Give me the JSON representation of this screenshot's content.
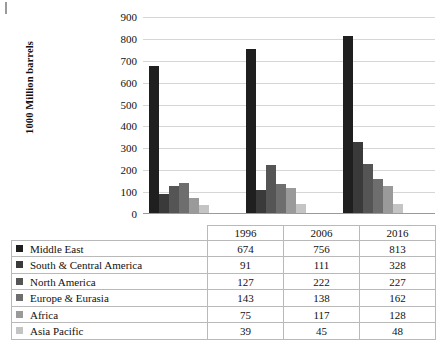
{
  "chart_data": {
    "type": "bar",
    "title": "",
    "xlabel": "",
    "ylabel": "1000 Million barrels",
    "categories": [
      "1996",
      "2006",
      "2016"
    ],
    "ylim": [
      0,
      900
    ],
    "yticks": [
      0,
      100,
      200,
      300,
      400,
      500,
      600,
      700,
      800,
      900
    ],
    "grid": true,
    "legend_position": "table-below",
    "series": [
      {
        "name": "Middle East",
        "values": [
          674,
          756,
          813
        ],
        "color": "#1f1f1f"
      },
      {
        "name": "South & Central America",
        "values": [
          91,
          111,
          328
        ],
        "color": "#3a3a3a"
      },
      {
        "name": "North America",
        "values": [
          127,
          222,
          227
        ],
        "color": "#555555"
      },
      {
        "name": "Europe & Eurasia",
        "values": [
          143,
          138,
          162
        ],
        "color": "#6e6e6e"
      },
      {
        "name": "Africa",
        "values": [
          75,
          117,
          128
        ],
        "color": "#9a9a9a"
      },
      {
        "name": "Asia Pacific",
        "values": [
          39,
          45,
          48
        ],
        "color": "#c4c4c4"
      }
    ]
  },
  "table": {
    "corner_label": "",
    "column_headers": [
      "1996",
      "2006",
      "2016"
    ],
    "rows": [
      {
        "label": "Middle East",
        "values": [
          "674",
          "756",
          "813"
        ]
      },
      {
        "label": "South & Central America",
        "values": [
          "91",
          "111",
          "328"
        ]
      },
      {
        "label": "North America",
        "values": [
          "127",
          "222",
          "227"
        ]
      },
      {
        "label": "Europe & Eurasia",
        "values": [
          "143",
          "138",
          "162"
        ]
      },
      {
        "label": "Africa",
        "values": [
          "75",
          "117",
          "128"
        ]
      },
      {
        "label": "Asia Pacific",
        "values": [
          "39",
          "45",
          "48"
        ]
      }
    ]
  },
  "axis": {
    "y_title": "1000 Million barrels",
    "tick_labels": [
      "900",
      "800",
      "700",
      "600",
      "500",
      "400",
      "300",
      "200",
      "100",
      "0"
    ]
  }
}
